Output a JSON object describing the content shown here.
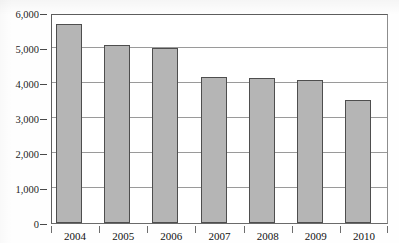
{
  "chart_data": {
    "type": "bar",
    "title": "",
    "xlabel": "",
    "ylabel": "",
    "categories": [
      "2004",
      "2005",
      "2006",
      "2007",
      "2008",
      "2009",
      "2010"
    ],
    "values": [
      5700,
      5080,
      5000,
      4180,
      4130,
      4100,
      3520
    ],
    "series": [
      {
        "name": "",
        "values": [
          5700,
          5080,
          5000,
          4180,
          4130,
          4100,
          3520
        ]
      }
    ],
    "ylim": [
      0,
      6000
    ],
    "y_ticks": [
      0,
      1000,
      2000,
      3000,
      4000,
      5000,
      6000
    ],
    "y_tick_labels": [
      "0",
      "1,000",
      "2,000",
      "3,000",
      "4,000",
      "5,000",
      "6,000"
    ],
    "grid": true,
    "legend": "none",
    "bar_fill_color": "#b5b5b5",
    "bar_border_color": "#4e4e4e",
    "gridline_color": "#9a9a9a",
    "axis_color": "#5d5d5d"
  }
}
